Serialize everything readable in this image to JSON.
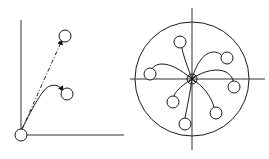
{
  "figure": {
    "width": 269,
    "height": 159,
    "background": "#ffffff",
    "stroke_color": "#1a1a1a"
  },
  "left_diagram": {
    "label": "",
    "axes": {
      "origin": [
        21,
        135
      ],
      "y_axis_top": [
        21,
        20
      ],
      "x_axis_right": [
        124,
        135
      ]
    },
    "origin_node": {
      "cx": 21,
      "cy": 135,
      "r": 6
    },
    "targets": [
      {
        "id": "upper-target",
        "cx": 65,
        "cy": 36,
        "r": 6,
        "connection": "dashed-straight-arrow"
      },
      {
        "id": "lower-target",
        "cx": 67,
        "cy": 94,
        "r": 6,
        "connection": "curved-arrow"
      }
    ]
  },
  "right_diagram": {
    "label": "",
    "boundary_circle": {
      "cx": 192,
      "cy": 79,
      "r": 57
    },
    "crosshair": {
      "horizontal": {
        "x1": 130,
        "x2": 265,
        "y": 79
      },
      "vertical": {
        "x": 192,
        "y1": 8,
        "y2": 150
      }
    },
    "center_node": {
      "cx": 192,
      "cy": 79,
      "r": 5
    },
    "satellites": [
      {
        "id": "sat-top",
        "cx": 180,
        "cy": 42,
        "r": 6
      },
      {
        "id": "sat-top-right",
        "cx": 227,
        "cy": 58,
        "r": 6
      },
      {
        "id": "sat-left",
        "cx": 150,
        "cy": 74,
        "r": 6
      },
      {
        "id": "sat-right",
        "cx": 234,
        "cy": 87,
        "r": 6
      },
      {
        "id": "sat-bottom-left",
        "cx": 173,
        "cy": 102,
        "r": 6
      },
      {
        "id": "sat-bottom-right",
        "cx": 216,
        "cy": 113,
        "r": 6
      },
      {
        "id": "sat-bottom",
        "cx": 185,
        "cy": 124,
        "r": 6
      }
    ]
  }
}
